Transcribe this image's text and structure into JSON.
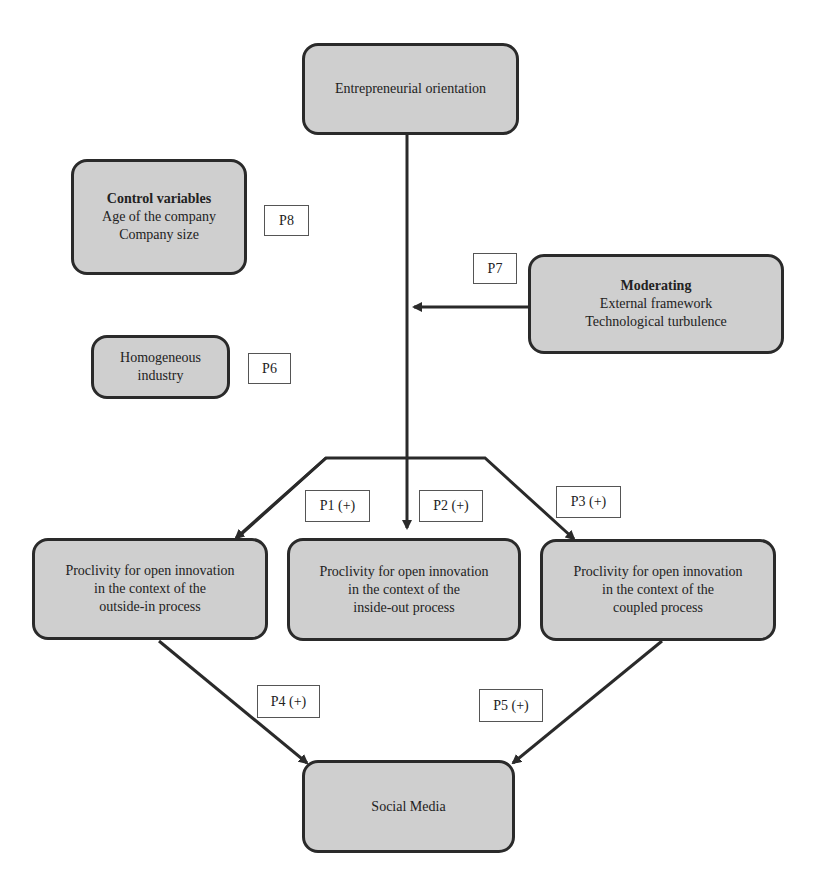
{
  "diagram": {
    "nodes": {
      "eo": {
        "lines": [
          "Entrepreneurial orientation"
        ]
      },
      "control": {
        "title": "Control variables",
        "lines": [
          "Age of the company",
          "Company size"
        ]
      },
      "homogeneous": {
        "lines": [
          "Homogeneous",
          "industry"
        ]
      },
      "moderating": {
        "title": "Moderating",
        "lines": [
          "External framework",
          "Technological turbulence"
        ]
      },
      "outside_in": {
        "lines": [
          "Proclivity for open innovation",
          "in the context of the",
          "outside-in process"
        ]
      },
      "inside_out": {
        "lines": [
          "Proclivity for open innovation",
          "in the context of the",
          "inside-out process"
        ]
      },
      "coupled": {
        "lines": [
          "Proclivity for open innovation",
          "in the context of the",
          "coupled process"
        ]
      },
      "social": {
        "lines": [
          "Social Media"
        ]
      }
    },
    "labels": {
      "p1": "P1 (+)",
      "p2": "P2 (+)",
      "p3": "P3 (+)",
      "p4": "P4 (+)",
      "p5": "P5 (+)",
      "p6": "P6",
      "p7": "P7",
      "p8": "P8"
    },
    "colors": {
      "node_fill": "#cfcfcf",
      "stroke": "#2a2a2a"
    }
  }
}
